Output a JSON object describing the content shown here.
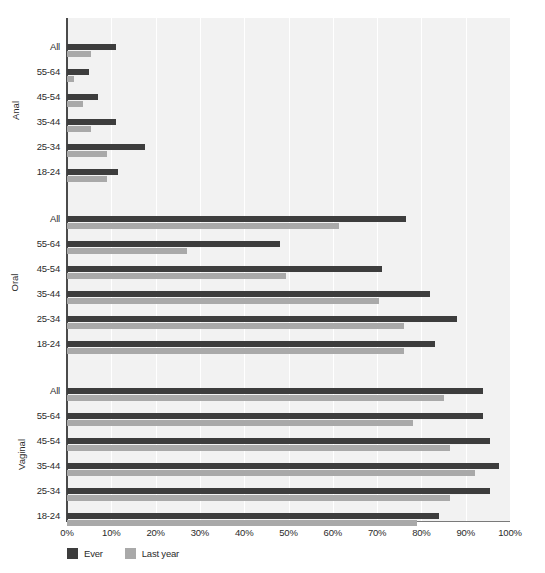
{
  "chart_data": {
    "type": "bar",
    "orientation": "horizontal",
    "title": "",
    "subtitle": "",
    "xlabel": "",
    "ylabel": "",
    "xlim": [
      0,
      100
    ],
    "xticks": [
      0,
      10,
      20,
      30,
      40,
      50,
      60,
      70,
      80,
      90,
      100
    ],
    "xtick_labels": [
      "0%",
      "10%",
      "20%",
      "30%",
      "40%",
      "50%",
      "60%",
      "70%",
      "80%",
      "90%",
      "100%"
    ],
    "grid": true,
    "grid_axis": "x",
    "legend": {
      "position": "bottom-left",
      "entries": [
        {
          "name": "Ever",
          "color": "#3d3d3d"
        },
        {
          "name": "Last year",
          "color": "#a9a9a9"
        }
      ]
    },
    "series": [
      {
        "name": "Ever",
        "color": "#3d3d3d"
      },
      {
        "name": "Last year",
        "color": "#a9a9a9"
      }
    ],
    "categories": [
      "18-24",
      "25-34",
      "35-44",
      "45-54",
      "55-64",
      "All"
    ],
    "groups": [
      {
        "name": "Anal",
        "rows": [
          {
            "label": "All",
            "ever": 11.0,
            "last_year": 5.5
          },
          {
            "label": "55-64",
            "ever": 5.0,
            "last_year": 1.5
          },
          {
            "label": "45-54",
            "ever": 7.0,
            "last_year": 3.5
          },
          {
            "label": "35-44",
            "ever": 11.0,
            "last_year": 5.5
          },
          {
            "label": "25-34",
            "ever": 17.5,
            "last_year": 9.0
          },
          {
            "label": "18-24",
            "ever": 11.5,
            "last_year": 9.0
          }
        ]
      },
      {
        "name": "Oral",
        "rows": [
          {
            "label": "All",
            "ever": 76.5,
            "last_year": 61.5
          },
          {
            "label": "55-64",
            "ever": 48.0,
            "last_year": 27.0
          },
          {
            "label": "45-54",
            "ever": 71.0,
            "last_year": 49.5
          },
          {
            "label": "35-44",
            "ever": 82.0,
            "last_year": 70.5
          },
          {
            "label": "25-34",
            "ever": 88.0,
            "last_year": 76.0
          },
          {
            "label": "18-24",
            "ever": 83.0,
            "last_year": 76.0
          }
        ]
      },
      {
        "name": "Vaginal",
        "rows": [
          {
            "label": "All",
            "ever": 94.0,
            "last_year": 85.0
          },
          {
            "label": "55-64",
            "ever": 94.0,
            "last_year": 78.0
          },
          {
            "label": "45-54",
            "ever": 95.5,
            "last_year": 86.5
          },
          {
            "label": "35-44",
            "ever": 97.5,
            "last_year": 92.0
          },
          {
            "label": "25-34",
            "ever": 95.5,
            "last_year": 86.5
          },
          {
            "label": "18-24",
            "ever": 84.0,
            "last_year": 79.0
          }
        ]
      }
    ]
  },
  "colors": {
    "ever": "#3d3d3d",
    "last_year": "#a9a9a9",
    "plot_background": "#f2f2f2",
    "gridline": "#ffffff",
    "axis": "#4a4a4a",
    "text": "#2b2b2b"
  }
}
